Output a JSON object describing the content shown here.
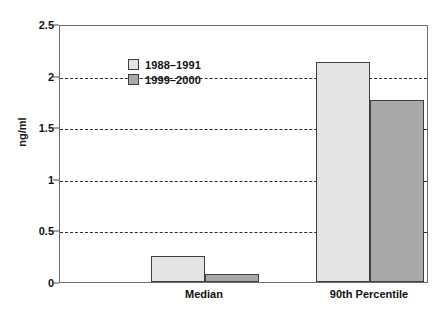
{
  "chart_data": {
    "type": "bar",
    "title": "",
    "subtitle": "",
    "xlabel": "",
    "ylabel": "ng/ml",
    "categories": [
      "Median",
      "90th Percentile"
    ],
    "series": [
      {
        "name": "1988–1991",
        "values": [
          0.25,
          2.13
        ],
        "color": "#e3e3e3"
      },
      {
        "name": "1999–2000",
        "values": [
          0.08,
          1.76
        ],
        "color": "#a9a9a9"
      }
    ],
    "ylim": [
      0,
      2.5
    ],
    "yticks": [
      0,
      0.5,
      1,
      1.5,
      2,
      2.5
    ],
    "ytick_labels": [
      "0",
      "0.5",
      "1",
      "1.5",
      "2",
      "2.5"
    ],
    "gridlines": {
      "axis": "y",
      "values": [
        0.5,
        1,
        1.5,
        2
      ],
      "style": "dashed",
      "color": "#2b2b2b"
    },
    "grid": true,
    "legend": {
      "position": "upper-center-left",
      "entries": [
        "1988–1991",
        "1999–2000"
      ]
    },
    "bar_border_color": "#3f3f3f",
    "frame_color": "#6e6e6e",
    "background": "#ffffff"
  }
}
